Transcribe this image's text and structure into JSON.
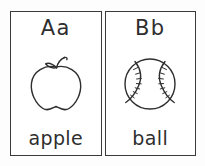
{
  "worksheet": {
    "title": "Alphabet flashcards A and B",
    "background_color": "#fdfdfd",
    "ink_color": "#2e2e2e",
    "card_border_color": "#3a3a3a",
    "card_fill_color": "#ffffff"
  },
  "cards": [
    {
      "id": "card-a",
      "letters": "Aa",
      "word": "apple",
      "illustration": "apple-line-drawing",
      "illustration_description": "Outline drawing of an apple with a curved stem and a small leaf"
    },
    {
      "id": "card-b",
      "letters": "Bb",
      "word": "ball",
      "illustration": "baseball-line-drawing",
      "illustration_description": "Outline drawing of a baseball with two curved seams and stitch marks"
    }
  ]
}
